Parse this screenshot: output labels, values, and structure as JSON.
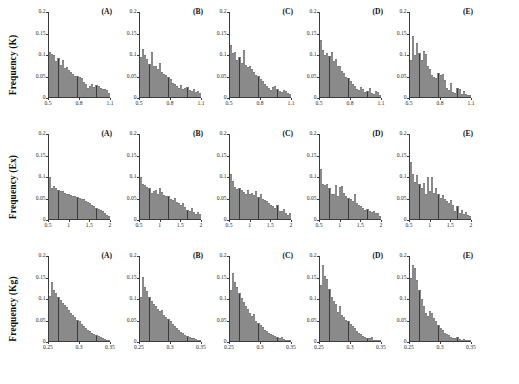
{
  "figure": {
    "rows": 3,
    "cols": 5,
    "bar_color": "#3b3b3b",
    "axis_color": "#3c3c3c",
    "background": "#ffffff"
  },
  "chart_data": [
    {
      "type": "bar",
      "title": "(A)",
      "row_label": "Frequency (K)",
      "xlabel": "",
      "ylabel": "Frequency (K)",
      "xlim": [
        0.5,
        1.1
      ],
      "ylim": [
        0,
        0.2
      ],
      "xticks": [
        "0.5",
        "0.8",
        "1.1"
      ],
      "yticks": [
        "0",
        "0.05",
        "0.1",
        "0.15",
        "0.2"
      ],
      "grid": false,
      "values": [
        0.107,
        0.101,
        0.098,
        0.084,
        0.092,
        0.076,
        0.088,
        0.068,
        0.07,
        0.064,
        0.058,
        0.055,
        0.05,
        0.05,
        0.047,
        0.045,
        0.036,
        0.03,
        0.022,
        0.026,
        0.031,
        0.023,
        0.028,
        0.026,
        0.022,
        0.019,
        0.018,
        0.016,
        0.01
      ]
    },
    {
      "type": "bar",
      "title": "(B)",
      "row_label": "Frequency (K)",
      "xlabel": "",
      "ylabel": "",
      "xlim": [
        0.5,
        1.1
      ],
      "ylim": [
        0,
        0.2
      ],
      "xticks": [
        "0.5",
        "0.8",
        "1.1"
      ],
      "yticks": [
        "0",
        "0.05",
        "0.1",
        "0.15",
        "0.2"
      ],
      "grid": false,
      "values": [
        0.095,
        0.112,
        0.098,
        0.09,
        0.078,
        0.106,
        0.074,
        0.072,
        0.066,
        0.079,
        0.06,
        0.054,
        0.052,
        0.046,
        0.043,
        0.034,
        0.03,
        0.026,
        0.022,
        0.029,
        0.018,
        0.022,
        0.024,
        0.016,
        0.014,
        0.02,
        0.012,
        0.015,
        0.009
      ]
    },
    {
      "type": "bar",
      "title": "(C)",
      "row_label": "Frequency (K)",
      "xlabel": "",
      "ylabel": "",
      "xlim": [
        0.5,
        1.1
      ],
      "ylim": [
        0,
        0.2
      ],
      "xticks": [
        "0.5",
        "0.8",
        "1.1"
      ],
      "yticks": [
        "0",
        "0.05",
        "0.1",
        "0.15",
        "0.2"
      ],
      "grid": false,
      "values": [
        0.123,
        0.103,
        0.105,
        0.088,
        0.094,
        0.08,
        0.11,
        0.076,
        0.07,
        0.072,
        0.065,
        0.058,
        0.052,
        0.05,
        0.043,
        0.037,
        0.03,
        0.026,
        0.021,
        0.017,
        0.024,
        0.026,
        0.02,
        0.014,
        0.012,
        0.016,
        0.015,
        0.009,
        0.007
      ]
    },
    {
      "type": "bar",
      "title": "(D)",
      "row_label": "Frequency (K)",
      "xlabel": "",
      "ylabel": "",
      "xlim": [
        0.5,
        1.1
      ],
      "ylim": [
        0,
        0.2
      ],
      "xticks": [
        "0.5",
        "0.8",
        "1.1"
      ],
      "yticks": [
        "0",
        "0.05",
        "0.1",
        "0.15",
        "0.2"
      ],
      "grid": false,
      "values": [
        0.133,
        0.11,
        0.1,
        0.104,
        0.096,
        0.105,
        0.084,
        0.09,
        0.074,
        0.072,
        0.062,
        0.057,
        0.048,
        0.044,
        0.037,
        0.031,
        0.025,
        0.019,
        0.016,
        0.024,
        0.018,
        0.012,
        0.014,
        0.021,
        0.01,
        0.008,
        0.013,
        0.011,
        0.005
      ]
    },
    {
      "type": "bar",
      "title": "(E)",
      "row_label": "Frequency (K)",
      "xlabel": "",
      "ylabel": "",
      "xlim": [
        0.5,
        1.1
      ],
      "ylim": [
        0,
        0.2
      ],
      "xticks": [
        "0.5",
        "0.8",
        "1.1"
      ],
      "yticks": [
        "0",
        "0.05",
        "0.1",
        "0.15",
        "0.2"
      ],
      "grid": false,
      "values": [
        0.086,
        0.144,
        0.098,
        0.126,
        0.104,
        0.088,
        0.108,
        0.101,
        0.072,
        0.066,
        0.052,
        0.047,
        0.044,
        0.056,
        0.052,
        0.053,
        0.04,
        0.022,
        0.016,
        0.032,
        0.012,
        0.01,
        0.022,
        0.02,
        0.008,
        0.015,
        0.006,
        0.005,
        0.004
      ]
    },
    {
      "type": "bar",
      "title": "(A)",
      "row_label": "Frequency (Ex)",
      "xlabel": "",
      "ylabel": "Frequency (Ex)",
      "xlim": [
        0.5,
        2.0
      ],
      "ylim": [
        0,
        0.2
      ],
      "xticks": [
        "0.5",
        "1",
        "1.5",
        "2"
      ],
      "yticks": [
        "0",
        "0.05",
        "0.1",
        "0.15",
        "0.2"
      ],
      "grid": false,
      "values": [
        0.098,
        0.074,
        0.078,
        0.072,
        0.068,
        0.065,
        0.066,
        0.062,
        0.06,
        0.058,
        0.056,
        0.055,
        0.053,
        0.052,
        0.05,
        0.048,
        0.046,
        0.043,
        0.04,
        0.037,
        0.034,
        0.031,
        0.027,
        0.024,
        0.022,
        0.018,
        0.014,
        0.01,
        0.008
      ]
    },
    {
      "type": "bar",
      "title": "(B)",
      "row_label": "Frequency (Ex)",
      "xlabel": "",
      "ylabel": "",
      "xlim": [
        0.5,
        2.0
      ],
      "ylim": [
        0,
        0.2
      ],
      "xticks": [
        "0.5",
        "1",
        "1.5",
        "2"
      ],
      "yticks": [
        "0",
        "0.05",
        "0.1",
        "0.15",
        "0.2"
      ],
      "grid": false,
      "values": [
        0.1,
        0.082,
        0.079,
        0.075,
        0.072,
        0.061,
        0.067,
        0.069,
        0.059,
        0.072,
        0.064,
        0.057,
        0.054,
        0.053,
        0.048,
        0.045,
        0.05,
        0.04,
        0.037,
        0.033,
        0.038,
        0.028,
        0.022,
        0.02,
        0.026,
        0.017,
        0.012,
        0.016,
        0.011
      ]
    },
    {
      "type": "bar",
      "title": "(C)",
      "row_label": "Frequency (Ex)",
      "xlabel": "",
      "ylabel": "",
      "xlim": [
        0.5,
        2.0
      ],
      "ylim": [
        0,
        0.2
      ],
      "xticks": [
        "0.5",
        "1",
        "1.5",
        "2"
      ],
      "yticks": [
        "0",
        "0.05",
        "0.1",
        "0.15",
        "0.2"
      ],
      "grid": false,
      "values": [
        0.107,
        0.09,
        0.076,
        0.07,
        0.074,
        0.068,
        0.064,
        0.06,
        0.068,
        0.058,
        0.062,
        0.056,
        0.066,
        0.052,
        0.058,
        0.048,
        0.045,
        0.042,
        0.038,
        0.034,
        0.03,
        0.026,
        0.032,
        0.02,
        0.018,
        0.023,
        0.014,
        0.01,
        0.013
      ]
    },
    {
      "type": "bar",
      "title": "(D)",
      "row_label": "Frequency (Ex)",
      "xlabel": "",
      "ylabel": "",
      "xlim": [
        0.5,
        2.0
      ],
      "ylim": [
        0,
        0.2
      ],
      "xticks": [
        "0.5",
        "1",
        "1.5",
        "2"
      ],
      "yticks": [
        "0",
        "0.05",
        "0.1",
        "0.15",
        "0.2"
      ],
      "grid": false,
      "values": [
        0.118,
        0.082,
        0.08,
        0.083,
        0.074,
        0.06,
        0.058,
        0.081,
        0.054,
        0.076,
        0.078,
        0.062,
        0.055,
        0.05,
        0.046,
        0.043,
        0.06,
        0.038,
        0.034,
        0.03,
        0.027,
        0.022,
        0.024,
        0.018,
        0.016,
        0.02,
        0.013,
        0.015,
        0.008
      ]
    },
    {
      "type": "bar",
      "title": "(E)",
      "row_label": "Frequency (Ex)",
      "xlabel": "",
      "ylabel": "",
      "xlim": [
        0.5,
        2.0
      ],
      "ylim": [
        0,
        0.2
      ],
      "xticks": [
        "0.5",
        "1",
        "1.5",
        "2"
      ],
      "yticks": [
        "0",
        "0.05",
        "0.1",
        "0.15",
        "0.2"
      ],
      "grid": false,
      "values": [
        0.134,
        0.106,
        0.088,
        0.104,
        0.082,
        0.072,
        0.085,
        0.06,
        0.1,
        0.066,
        0.098,
        0.062,
        0.074,
        0.058,
        0.05,
        0.056,
        0.046,
        0.042,
        0.038,
        0.044,
        0.034,
        0.018,
        0.03,
        0.014,
        0.022,
        0.012,
        0.016,
        0.009,
        0.006
      ]
    },
    {
      "type": "bar",
      "title": "(A)",
      "row_label": "Frequency (Kg)",
      "xlabel": "",
      "ylabel": "Frequency (Kg)",
      "xlim": [
        0.25,
        0.35
      ],
      "ylim": [
        0,
        0.2
      ],
      "xticks": [
        "0.25",
        "0.3",
        "0.35"
      ],
      "yticks": [
        "0",
        "0.05",
        "0.1",
        "0.15",
        "0.2"
      ],
      "grid": false,
      "values": [
        0.106,
        0.138,
        0.12,
        0.112,
        0.104,
        0.097,
        0.09,
        0.085,
        0.079,
        0.073,
        0.067,
        0.061,
        0.056,
        0.05,
        0.046,
        0.041,
        0.036,
        0.031,
        0.027,
        0.023,
        0.02,
        0.017,
        0.014,
        0.011,
        0.009,
        0.007,
        0.005,
        0.003,
        0.002
      ]
    },
    {
      "type": "bar",
      "title": "(B)",
      "row_label": "Frequency (Kg)",
      "xlabel": "",
      "ylabel": "",
      "xlim": [
        0.25,
        0.35
      ],
      "ylim": [
        0,
        0.2
      ],
      "xticks": [
        "0.25",
        "0.3",
        "0.35"
      ],
      "yticks": [
        "0",
        "0.05",
        "0.1",
        "0.15",
        "0.2"
      ],
      "grid": false,
      "values": [
        0.104,
        0.15,
        0.128,
        0.118,
        0.104,
        0.095,
        0.087,
        0.082,
        0.076,
        0.07,
        0.073,
        0.062,
        0.056,
        0.051,
        0.046,
        0.041,
        0.035,
        0.03,
        0.026,
        0.022,
        0.018,
        0.015,
        0.012,
        0.01,
        0.008,
        0.006,
        0.004,
        0.003,
        0.002
      ]
    },
    {
      "type": "bar",
      "title": "(C)",
      "row_label": "Frequency (Kg)",
      "xlabel": "",
      "ylabel": "",
      "xlim": [
        0.25,
        0.35
      ],
      "ylim": [
        0,
        0.2
      ],
      "xticks": [
        "0.25",
        "0.3",
        "0.35"
      ],
      "yticks": [
        "0",
        "0.05",
        "0.1",
        "0.15",
        "0.2"
      ],
      "grid": false,
      "values": [
        0.12,
        0.161,
        0.14,
        0.126,
        0.112,
        0.101,
        0.092,
        0.083,
        0.075,
        0.067,
        0.06,
        0.064,
        0.048,
        0.043,
        0.037,
        0.032,
        0.027,
        0.023,
        0.019,
        0.016,
        0.013,
        0.011,
        0.009,
        0.007,
        0.01,
        0.004,
        0.003,
        0.002,
        0.001
      ]
    },
    {
      "type": "bar",
      "title": "(D)",
      "row_label": "Frequency (Kg)",
      "xlabel": "",
      "ylabel": "",
      "xlim": [
        0.25,
        0.35
      ],
      "ylim": [
        0,
        0.2
      ],
      "xticks": [
        "0.25",
        "0.3",
        "0.35"
      ],
      "yticks": [
        "0",
        "0.05",
        "0.1",
        "0.15",
        "0.2"
      ],
      "grid": false,
      "values": [
        0.131,
        0.178,
        0.152,
        0.146,
        0.122,
        0.104,
        0.094,
        0.086,
        0.068,
        0.082,
        0.062,
        0.056,
        0.05,
        0.046,
        0.041,
        0.036,
        0.03,
        0.024,
        0.02,
        0.016,
        0.012,
        0.01,
        0.008,
        0.006,
        0.009,
        0.003,
        0.002,
        0.001,
        0.001
      ]
    },
    {
      "type": "bar",
      "title": "(E)",
      "row_label": "Frequency (Kg)",
      "xlabel": "",
      "ylabel": "",
      "xlim": [
        0.25,
        0.35
      ],
      "ylim": [
        0,
        0.2
      ],
      "xticks": [
        "0.25",
        "0.3",
        "0.35"
      ],
      "yticks": [
        "0",
        "0.05",
        "0.1",
        "0.15",
        "0.2"
      ],
      "grid": false,
      "values": [
        0.148,
        0.18,
        0.172,
        0.144,
        0.12,
        0.1,
        0.082,
        0.066,
        0.058,
        0.071,
        0.066,
        0.055,
        0.046,
        0.038,
        0.03,
        0.026,
        0.02,
        0.016,
        0.013,
        0.01,
        0.008,
        0.006,
        0.009,
        0.004,
        0.003,
        0.005,
        0.002,
        0.001,
        0.001
      ]
    }
  ],
  "caption": ""
}
